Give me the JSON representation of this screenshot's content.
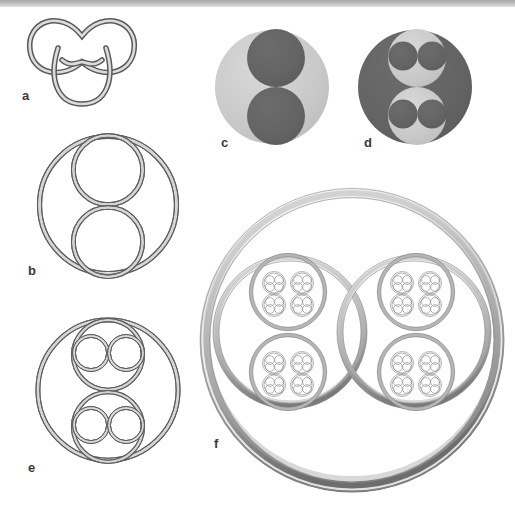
{
  "figure": {
    "background_color": "#ffffff",
    "width": 515,
    "height": 510,
    "top_rule": {
      "name": "top-divider-rule",
      "color_top": "#9a9a9a",
      "color_mid": "#b4b4b4",
      "color_bottom": "#d6d6d6",
      "x": 0,
      "y": 0,
      "w": 515,
      "h": 8
    },
    "palette": {
      "line_dark": "#575757",
      "line_mid": "#7d7d7d",
      "tube_fill_light": "#e9e9e9",
      "tube_fill_mid": "#c9c9c9",
      "solid_light_gray": "#c9c9c9",
      "solid_dark_gray": "#636363",
      "label_color": "#3a3a3a",
      "torus_highlight": "#f2f2f2",
      "torus_shadow": "#6f6f6f",
      "torus_body": "#b0b0b0"
    }
  },
  "panels": [
    {
      "id": "a",
      "label": "a",
      "name": "panel-a-trefoil-knot",
      "caption_hint": "trefoil knot drawn as a tube",
      "label_x": 22,
      "label_y": 88,
      "geometry": {
        "cx": 82,
        "cy": 55,
        "r": 38,
        "tube": 4
      },
      "style": "outline-tube"
    },
    {
      "id": "b",
      "label": "b",
      "name": "panel-b-two-nested-rings",
      "caption_hint": "outer ring containing two tangent inner rings (iteration 1)",
      "label_x": 28,
      "label_y": 263,
      "geometry": {
        "cx": 108,
        "cy": 205,
        "r": 68,
        "tube": 3.2,
        "children": 2
      },
      "style": "outline-tube"
    },
    {
      "id": "c",
      "label": "c",
      "name": "panel-c-filled-disk-level1",
      "caption_hint": "light disk with two dark sub-disks (solid iteration 1)",
      "label_x": 221,
      "label_y": 143,
      "geometry": {
        "cx": 272,
        "cy": 87,
        "r": 57,
        "children": 2
      },
      "style": "solid"
    },
    {
      "id": "d",
      "label": "d",
      "name": "panel-d-filled-disk-level2",
      "caption_hint": "dark disk with two light sub-disks each holding two dark disks (solid iteration 2)",
      "label_x": 364,
      "label_y": 143,
      "geometry": {
        "cx": 415,
        "cy": 87,
        "r": 57,
        "children": 2,
        "depth": 2
      },
      "style": "solid"
    },
    {
      "id": "e",
      "label": "e",
      "name": "panel-e-four-nested-rings",
      "caption_hint": "outer ring, two inner rings, each with two smaller rings (iteration 2)",
      "label_x": 28,
      "label_y": 460,
      "geometry": {
        "cx": 108,
        "cy": 390,
        "r": 71,
        "tube": 3.0,
        "children": 2,
        "depth": 2
      },
      "style": "outline-tube"
    },
    {
      "id": "f",
      "label": "f",
      "name": "panel-f-rendered-torus-recursion",
      "caption_hint": "shaded 3D torus containing recursively nested tori (4 levels)",
      "label_x": 214,
      "label_y": 443,
      "geometry": {
        "cx": 352,
        "cy": 337,
        "r": 146,
        "tube": 11,
        "children": 2,
        "depth": 4
      },
      "style": "shaded-3d"
    }
  ]
}
